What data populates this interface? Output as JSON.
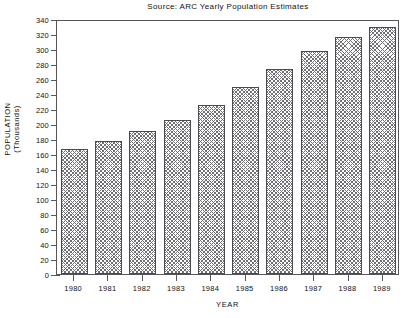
{
  "chart_data": {
    "type": "bar",
    "title": "Source: ARC Yearly Population Estimates",
    "xlabel": "YEAR",
    "ylabel": "POPULATION",
    "ylabel_line2": "(Thousands)",
    "categories": [
      "1980",
      "1981",
      "1982",
      "1983",
      "1984",
      "1985",
      "1986",
      "1987",
      "1988",
      "1989"
    ],
    "values": [
      167,
      178,
      191,
      206,
      226,
      249,
      274,
      298,
      316,
      330
    ],
    "ylim": [
      0,
      340
    ],
    "ytick_labels": [
      "340",
      "320",
      "300",
      "280",
      "260",
      "240",
      "220",
      "200",
      "180",
      "160",
      "140",
      "120",
      "100",
      "80",
      "60",
      "40",
      "20",
      "0"
    ],
    "ytick_values": [
      340,
      320,
      300,
      280,
      260,
      240,
      220,
      200,
      180,
      160,
      140,
      120,
      100,
      80,
      60,
      40,
      20,
      0
    ],
    "grid": false,
    "legend": "none",
    "series_fill": "crosshatch",
    "colors": {
      "background": "#ffffff",
      "axis": "#55555a",
      "text": "#111111",
      "bar_pattern": "#6f6f74",
      "bar_border": "#4a4a4f"
    }
  }
}
